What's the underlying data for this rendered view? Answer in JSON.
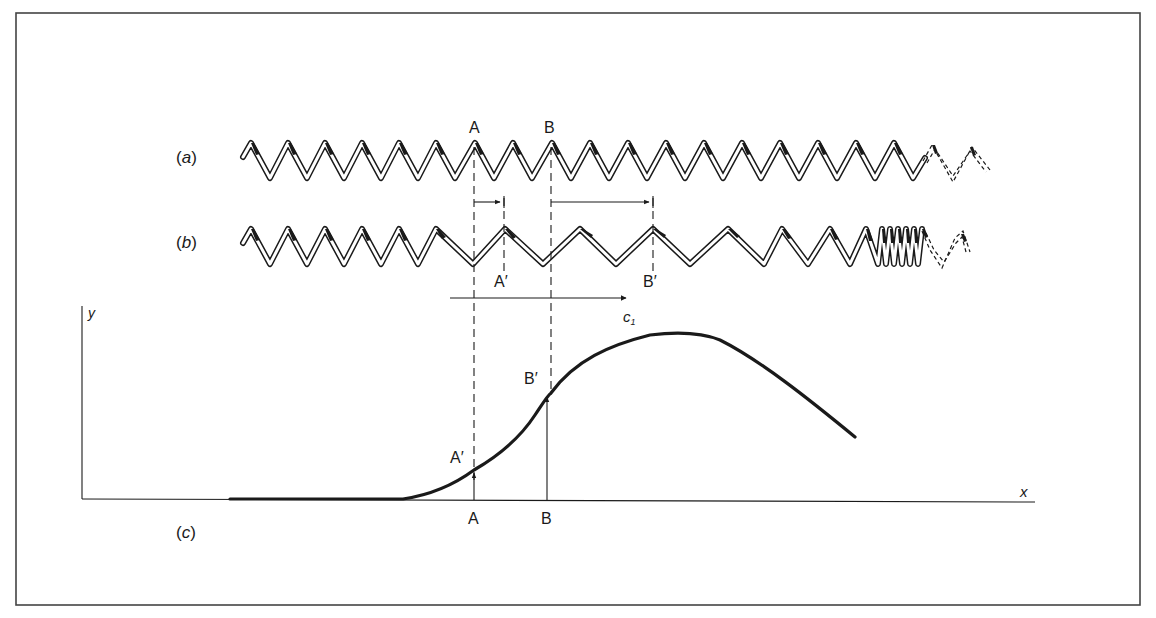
{
  "figure": {
    "panels": {
      "a": {
        "label": "(a)",
        "label_letter": "a"
      },
      "b": {
        "label": "(b)",
        "label_letter": "b"
      },
      "c": {
        "label": "(c)",
        "label_letter": "c"
      }
    },
    "points": {
      "A": "A",
      "B": "B",
      "A_prime": "A′",
      "B_prime": "B′"
    },
    "velocity_label": "c",
    "velocity_subscript": "1",
    "axes": {
      "y": "y",
      "x": "x"
    },
    "colors": {
      "ink": "#1a1a1a",
      "frame": "#444444",
      "background": "#ffffff"
    }
  }
}
